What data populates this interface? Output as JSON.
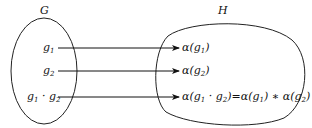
{
  "diagram": {
    "type": "function-mapping",
    "domain_set": {
      "label": "G",
      "elements": [
        "g1",
        "g2",
        "g1 · g2"
      ]
    },
    "codomain_set": {
      "label": "H",
      "elements": [
        "α(g1)",
        "α(g2)",
        "α(g1 · g2) = α(g1) * α(g2)"
      ]
    },
    "mappings": [
      {
        "from": "g1",
        "to": "α(g1)"
      },
      {
        "from": "g2",
        "to": "α(g2)"
      },
      {
        "from": "g1 · g2",
        "to": "α(g1 · g2) = α(g1) * α(g2)"
      }
    ]
  },
  "labels": {
    "G": "G",
    "H": "H",
    "g": "g",
    "alpha": "α",
    "s1": "1",
    "s2": "2"
  }
}
